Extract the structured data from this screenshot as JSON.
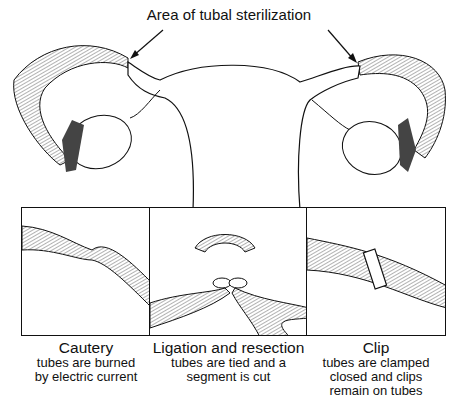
{
  "diagram": {
    "title": "Area of tubal sterilization",
    "panels": [
      {
        "heading": "Cautery",
        "lines": [
          "tubes are burned",
          "by electric current"
        ]
      },
      {
        "heading": "Ligation and resection",
        "lines": [
          "tubes are tied and a",
          "segment is cut"
        ]
      },
      {
        "heading": "Clip",
        "lines": [
          "tubes are clamped",
          "closed and clips",
          "remain on tubes"
        ]
      }
    ]
  }
}
